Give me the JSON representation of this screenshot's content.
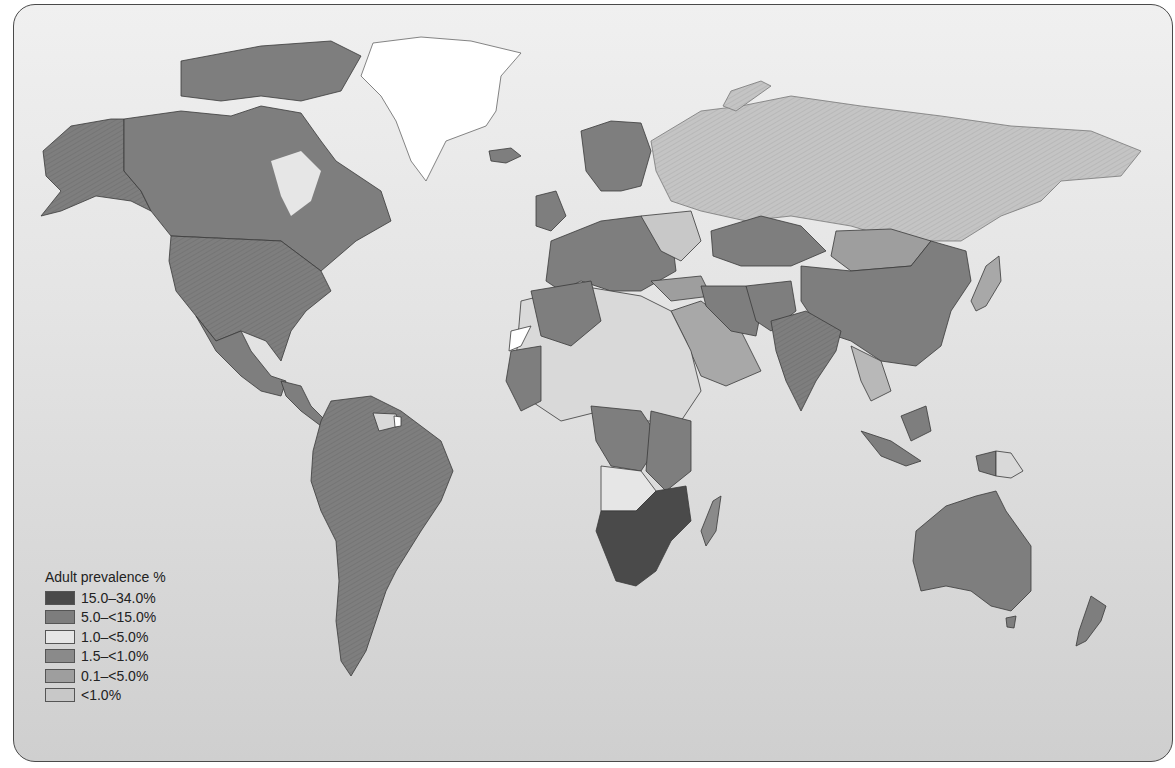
{
  "map": {
    "type": "choropleth world map",
    "subject": "Adult HIV prevalence by country",
    "colors": {
      "background_top": "#f0f0f0",
      "background_bottom": "#cfcfcf",
      "c1": "#4a4a4a",
      "c2": "#7d7d7d",
      "c3": "#d9d9d9",
      "c4": "#8a8a8a",
      "c5": "#a3a3a3",
      "c6": "#c2c2c2",
      "no_data": "#ffffff",
      "border": "#2e2e2e"
    },
    "regions": [
      {
        "name": "Southern Africa",
        "category": "15.0–34.0%"
      },
      {
        "name": "North America",
        "category": "5.0–<15.0%"
      },
      {
        "name": "South America",
        "category": "5.0–<15.0%"
      },
      {
        "name": "Australia",
        "category": "5.0–<15.0%"
      },
      {
        "name": "China",
        "category": "5.0–<15.0%"
      },
      {
        "name": "Russia",
        "category": "<1.0%"
      },
      {
        "name": "Greenland",
        "category": "no data"
      }
    ]
  },
  "legend": {
    "title": "Adult prevalence %",
    "items": [
      {
        "label": "15.0–34.0%",
        "color": "#4a4a4a"
      },
      {
        "label": "5.0–<15.0%",
        "color": "#7d7d7d"
      },
      {
        "label": "1.0–<5.0%",
        "color": "#e6e6e6"
      },
      {
        "label": "1.5–<1.0%",
        "color": "#8a8a8a"
      },
      {
        "label": "0.1–<5.0%",
        "color": "#9e9e9e"
      },
      {
        "label": "<1.0%",
        "color": "#c8c8c8"
      }
    ]
  }
}
